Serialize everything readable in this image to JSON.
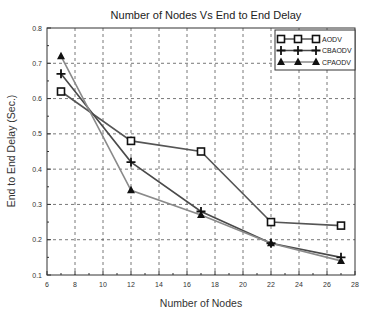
{
  "chart_data": {
    "type": "line",
    "title": "Number of Nodes Vs End to End Delay",
    "xlabel": "Number of Nodes",
    "ylabel": "End to End Delay (Sec.)",
    "xlim": [
      6,
      28
    ],
    "ylim": [
      0.1,
      0.8
    ],
    "xticks": [
      6,
      8,
      10,
      12,
      14,
      16,
      18,
      20,
      22,
      24,
      26,
      28
    ],
    "yticks": [
      0.1,
      0.2,
      0.3,
      0.4,
      0.5,
      0.6,
      0.7,
      0.8
    ],
    "xtick_labels": [
      "6",
      "8",
      "10",
      "12",
      "14",
      "16",
      "18",
      "20",
      "22",
      "24",
      "26",
      "28"
    ],
    "ytick_labels": [
      "0.1",
      "0.2",
      "0.3",
      "0.4",
      "0.5",
      "0.6",
      "0.7",
      "0.8"
    ],
    "grid": true,
    "legend_position": "top-right",
    "x": [
      7,
      12,
      17,
      22,
      27
    ],
    "series": [
      {
        "name": "AODV",
        "marker": "square",
        "color": "#555555",
        "values": [
          0.62,
          0.48,
          0.45,
          0.25,
          0.24
        ]
      },
      {
        "name": "CBAODV",
        "marker": "plus",
        "color": "#4a4a4a",
        "values": [
          0.67,
          0.42,
          0.28,
          0.19,
          0.15
        ]
      },
      {
        "name": "CPAODV",
        "marker": "triangle",
        "color": "#8a8a8a",
        "values": [
          0.72,
          0.34,
          0.27,
          0.19,
          0.14
        ]
      }
    ]
  }
}
